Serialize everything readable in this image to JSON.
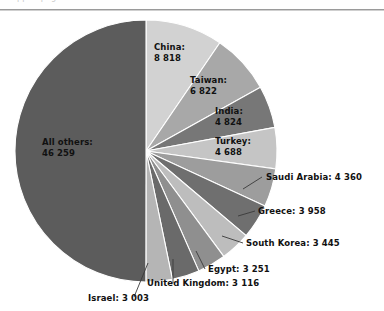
{
  "header": {
    "ghost_text": "cropped page header text",
    "divider": "horizontal-rule"
  },
  "chart_data": {
    "type": "pie",
    "title": "",
    "subtitle": "",
    "xlabel": "",
    "ylabel": "",
    "legend_position": "none",
    "grid": false,
    "total": 92544,
    "number_group_separator": "space",
    "start_angle_deg": 0,
    "direction": "clockwise",
    "categories": [
      "China",
      "Taiwan",
      "India",
      "Turkey",
      "Saudi Arabia",
      "Greece",
      "South Korea",
      "Egypt",
      "United Kingdom",
      "Israel",
      "All others"
    ],
    "values": [
      8818,
      6822,
      4824,
      4688,
      4360,
      3958,
      3445,
      3251,
      3116,
      3003,
      46259
    ],
    "value_labels": [
      "8 818",
      "6 822",
      "4 824",
      "4 688",
      "4 360",
      "3 958",
      "3 445",
      "3 251",
      "3 116",
      "3 003",
      "46  259"
    ],
    "slice_colors": [
      "#d2d2d2",
      "#a8a8a8",
      "#777777",
      "#c5c5c5",
      "#9d9d9d",
      "#6f6f6f",
      "#bdbdbd",
      "#8f8f8f",
      "#6a6a6a",
      "#b5b5b5",
      "#5c5c5c"
    ],
    "slices": [
      {
        "name": "China",
        "value": 8818,
        "label": "China:",
        "value_text": "8 818",
        "placement": "inside"
      },
      {
        "name": "Taiwan",
        "value": 6822,
        "label": "Taiwan:",
        "value_text": "6 822",
        "placement": "inside"
      },
      {
        "name": "India",
        "value": 4824,
        "label": "India:",
        "value_text": "4 824",
        "placement": "inside"
      },
      {
        "name": "Turkey",
        "value": 4688,
        "label": "Turkey:",
        "value_text": "4 688",
        "placement": "inside"
      },
      {
        "name": "Saudi Arabia",
        "value": 4360,
        "label": "Saudi Arabia: 4 360",
        "placement": "outside"
      },
      {
        "name": "Greece",
        "value": 3958,
        "label": "Greece: 3 958",
        "placement": "outside"
      },
      {
        "name": "South Korea",
        "value": 3445,
        "label": "South Korea:  3 445",
        "placement": "outside"
      },
      {
        "name": "Egypt",
        "value": 3251,
        "label": "Egypt: 3 251",
        "placement": "outside"
      },
      {
        "name": "United Kingdom",
        "value": 3116,
        "label": "United Kingdom: 3 116",
        "placement": "outside"
      },
      {
        "name": "Israel",
        "value": 3003,
        "label": "Israel: 3 003",
        "placement": "outside"
      },
      {
        "name": "All others",
        "value": 46259,
        "label": "All others:",
        "value_text": "46  259",
        "placement": "inside"
      }
    ]
  },
  "labels": {
    "china_name": "China:",
    "china_value": "8 818",
    "taiwan_name": "Taiwan:",
    "taiwan_value": "6 822",
    "india_name": "India:",
    "india_value": "4 824",
    "turkey_name": "Turkey:",
    "turkey_value": "4 688",
    "allothers_name": "All others:",
    "allothers_value": "46  259",
    "saudi": "Saudi Arabia: 4 360",
    "greece": "Greece: 3 958",
    "southkorea": "South Korea:  3 445",
    "egypt": "Egypt: 3 251",
    "uk": "United Kingdom: 3 116",
    "israel": "Israel: 3 003"
  },
  "colors": {
    "background": "#ffffff",
    "text": "#111111",
    "leader_line": "#3a3a3a",
    "rule": "#9a9a9a"
  }
}
